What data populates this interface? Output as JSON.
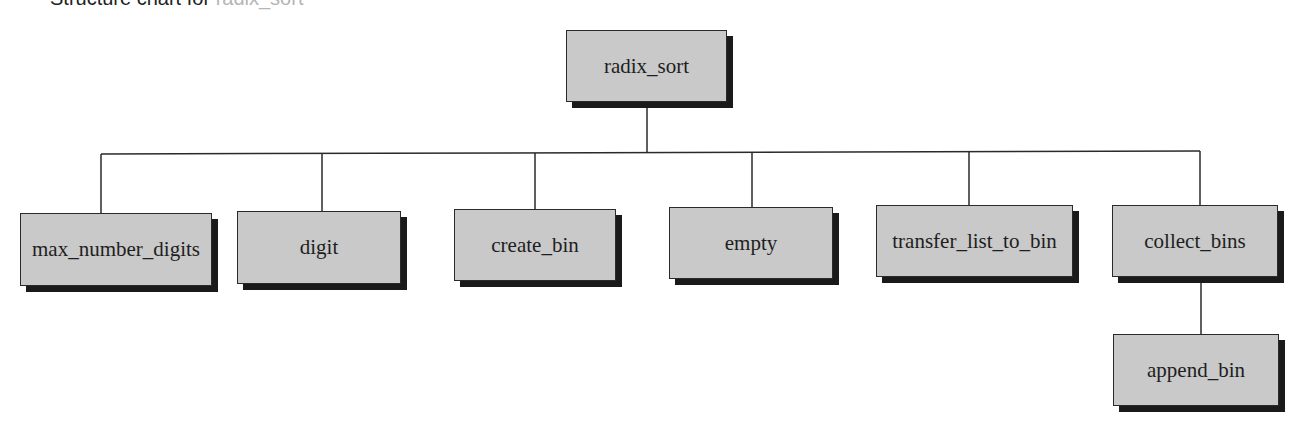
{
  "caption": {
    "text": "Structure chart for ",
    "faded": "radix_sort"
  },
  "diagram": {
    "type": "structure-chart",
    "root": "radix_sort",
    "nodes": [
      {
        "id": "radix_sort",
        "label": "radix_sort"
      },
      {
        "id": "max_number_digits",
        "label": "max_number_digits"
      },
      {
        "id": "digit",
        "label": "digit"
      },
      {
        "id": "create_bin",
        "label": "create_bin"
      },
      {
        "id": "empty",
        "label": "empty"
      },
      {
        "id": "transfer_list_to_bin",
        "label": "transfer_list_to_bin"
      },
      {
        "id": "collect_bins",
        "label": "collect_bins"
      },
      {
        "id": "append_bin",
        "label": "append_bin"
      }
    ],
    "edges": [
      {
        "from": "radix_sort",
        "to": "max_number_digits"
      },
      {
        "from": "radix_sort",
        "to": "digit"
      },
      {
        "from": "radix_sort",
        "to": "create_bin"
      },
      {
        "from": "radix_sort",
        "to": "empty"
      },
      {
        "from": "radix_sort",
        "to": "transfer_list_to_bin"
      },
      {
        "from": "radix_sort",
        "to": "collect_bins"
      },
      {
        "from": "collect_bins",
        "to": "append_bin"
      }
    ]
  },
  "colors": {
    "box_fill": "#c9c9c9",
    "box_border": "#2a2a2a",
    "shadow": "#1a1a1a",
    "line": "#2a2a2a"
  }
}
